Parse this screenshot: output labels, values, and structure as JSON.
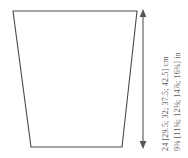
{
  "diagram": {
    "shape": {
      "name": "trapezoid-outline",
      "stroke_color": "#4a4a4a",
      "fill_color": "#ffffff",
      "points": "13,11 137,11 122,147 31,147"
    },
    "dimension_arrow": {
      "name": "vertical-double-arrow",
      "color": "#555555",
      "x": 143,
      "y_top": 11,
      "y_bottom": 147,
      "head_top": "up",
      "head_bottom": "down"
    },
    "labels": {
      "cm": "24 [29.5; 32; 37.5; 42.5] cm",
      "inches": "9⅜ [11⅝; 12⅝; 14⅞; 16¾] in"
    }
  },
  "chart_data": {
    "type": "table",
    "categories": [
      "size 1",
      "size 2",
      "size 3",
      "size 4",
      "size 5"
    ],
    "series": [
      {
        "name": "cm",
        "values": [
          24,
          29.5,
          32,
          37.5,
          42.5
        ]
      },
      {
        "name": "in",
        "values": [
          9.375,
          11.625,
          12.625,
          14.875,
          16.75
        ]
      }
    ],
    "ylabel": "height",
    "grid": false,
    "legend": "none"
  }
}
